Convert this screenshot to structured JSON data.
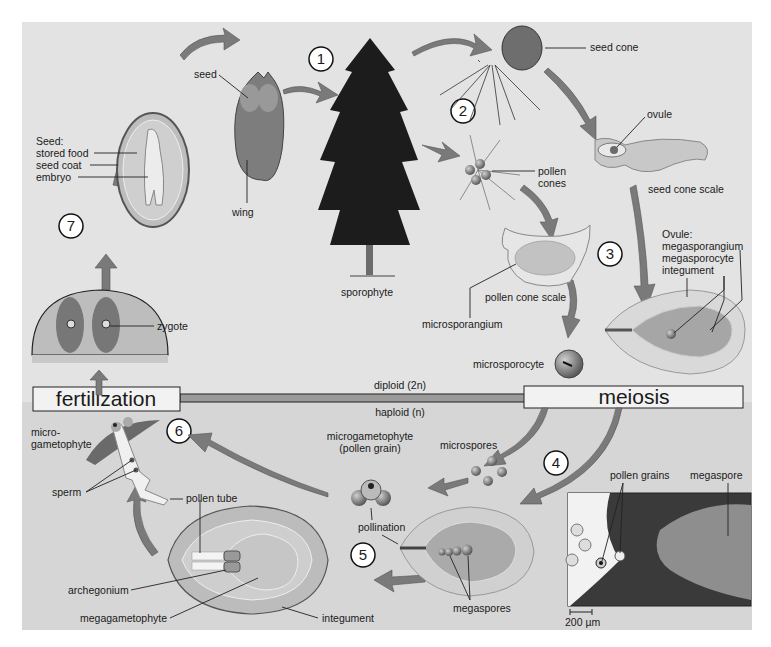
{
  "regions": {
    "diploid_label": "diploid (2n)",
    "haploid_label": "haploid (n)",
    "fertilization_label": "fertilization",
    "meiosis_label": "meiosis"
  },
  "steps": [
    "1",
    "2",
    "3",
    "4",
    "5",
    "6",
    "7"
  ],
  "labels": {
    "seed": "seed",
    "wing": "wing",
    "seed_title": "Seed:",
    "stored_food": "stored food",
    "seed_coat": "seed coat",
    "embryo": "embryo",
    "sporophyte": "sporophyte",
    "seed_cone": "seed cone",
    "ovule": "ovule",
    "seed_cone_scale": "seed cone scale",
    "pollen_cones_1": "pollen",
    "pollen_cones_2": "cones",
    "pollen_cone_scale": "pollen cone scale",
    "microsporangium": "microsporangium",
    "microsporocyte": "microsporocyte",
    "ovule_title": "Ovule:",
    "megasporangium": "megasporangium",
    "megasporocyte": "megasporocyte",
    "integument_top": "integument",
    "zygote": "zygote",
    "microgametophyte_1": "micro-",
    "microgametophyte_2": "gametophyte",
    "sperm": "sperm",
    "pollen_tube": "pollen tube",
    "archegonium": "archegonium",
    "megagametophyte": "megagametophyte",
    "integument_bottom": "integument",
    "microgametophyte_pg_1": "microgametophyte",
    "microgametophyte_pg_2": "(pollen grain)",
    "microspores": "microspores",
    "pollination": "pollination",
    "megaspores": "megaspores",
    "pollen_grains": "pollen grains",
    "megaspore": "megaspore",
    "scale_bar": "200 µm"
  },
  "colors": {
    "panel_upper": "#e3e3e3",
    "panel_lower": "#d6d6d6",
    "arrow": "#7a7a7a",
    "box_fill": "#f2f2f2"
  }
}
